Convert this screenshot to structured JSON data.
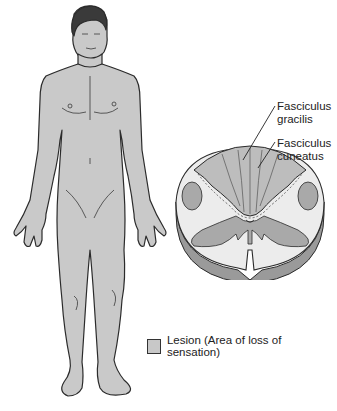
{
  "diagram": {
    "title": "",
    "labels": {
      "gracilis": "Fasciculus\ngracilis",
      "gracilis_line1": "Fasciculus",
      "gracilis_line2": "gracilis",
      "cuneatus_line1": "Fasciculus",
      "cuneatus_line2": "cuneatus"
    },
    "legend": {
      "swatch_color": "#c8c8c8",
      "text": "Lesion (Area of loss of sensation)"
    },
    "colors": {
      "body_fill": "#c9c9c9",
      "outline": "#2b2b2b",
      "white_matter": "#ececec",
      "gray_matter": "#a9a9a9",
      "dorsal_column": "#bdbdbd"
    },
    "parts": [
      "human-figure-anterior-view",
      "spinal-cord-cross-section",
      "fasciculus-gracilis",
      "fasciculus-cuneatus",
      "legend"
    ]
  }
}
